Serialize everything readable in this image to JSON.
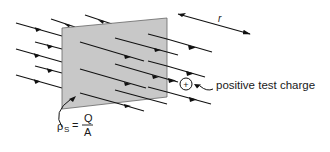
{
  "diagram": {
    "colors": {
      "plate_fill": "#c8c8c8",
      "plate_stroke": "#555555",
      "line": "#111111",
      "background": "#ffffff"
    },
    "labels": {
      "distance": "r",
      "test_charge": "positive test charge",
      "charge_symbol": "+",
      "density_symbol": "ρ",
      "density_subscript": "S",
      "equals": "=",
      "numerator": "Q",
      "denominator": "A"
    },
    "elements": {
      "plate": "charged sheet (shaded parallelogram)",
      "field_lines_left": "field lines pointing left (away from sheet)",
      "field_lines_right": "field lines pointing right (away from sheet)",
      "distance_arrow": "arrow indicating distance r from sheet",
      "test_charge": "circled plus sign",
      "density_pointer": "curved arrow from ρS label to plate"
    }
  }
}
